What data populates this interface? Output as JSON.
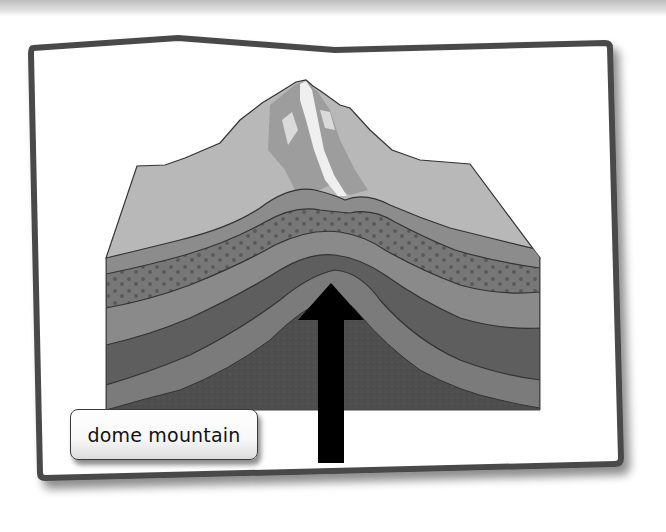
{
  "figure": {
    "label": "dome mountain",
    "arrow": {
      "direction": "up",
      "meaning": "uplift force from below"
    },
    "layers": [
      {
        "name": "surface-top",
        "fill": "#b4b4b4"
      },
      {
        "name": "layer-1",
        "fill": "#8c8c8c"
      },
      {
        "name": "layer-2-dotted",
        "fill": "#777777",
        "pattern": "dots"
      },
      {
        "name": "layer-3",
        "fill": "#8a8a8a"
      },
      {
        "name": "layer-4",
        "fill": "#5e5e5e"
      },
      {
        "name": "layer-5",
        "fill": "#7b7b7b"
      },
      {
        "name": "core",
        "fill": "#4d4d4d"
      }
    ],
    "colors": {
      "frame_border": "#4a4a4a",
      "arrow": "#000000",
      "snow": "#f2f2f2"
    }
  }
}
